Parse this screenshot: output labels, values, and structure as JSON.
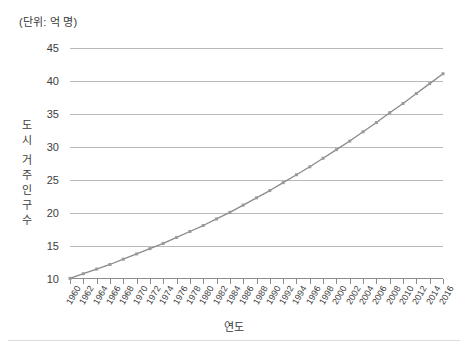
{
  "unit_caption": "(단위: 억 명)",
  "axis": {
    "y_title_chars": [
      "도",
      "시",
      "거",
      "주",
      "인",
      "구",
      "수"
    ],
    "x_title": "연도"
  },
  "chart_data": {
    "type": "line",
    "title": "",
    "subtitle": "",
    "unit_note": "(단위: 억 명)",
    "xlabel": "연도",
    "ylabel": "도시 거주 인구 수",
    "ylim": [
      10,
      45
    ],
    "ytick_step": 5,
    "ytick_labels": [
      "10",
      "15",
      "20",
      "25",
      "30",
      "35",
      "40",
      "45"
    ],
    "ytick_values": [
      10,
      15,
      20,
      25,
      30,
      35,
      40,
      45
    ],
    "xlim": [
      1960,
      2016
    ],
    "xtick_step": 2,
    "grid": "horizontal",
    "legend": "none",
    "marker": "square",
    "line_color": "#8a8a8a",
    "grid_color": "#b9b9b9",
    "categories": [
      "1960",
      "1962",
      "1964",
      "1966",
      "1968",
      "1970",
      "1972",
      "1974",
      "1976",
      "1978",
      "1980",
      "1982",
      "1984",
      "1986",
      "1988",
      "1990",
      "1992",
      "1994",
      "1996",
      "1998",
      "2000",
      "2002",
      "2004",
      "2006",
      "2008",
      "2010",
      "2012",
      "2014",
      "2016"
    ],
    "x": [
      1960,
      1962,
      1964,
      1966,
      1968,
      1970,
      1972,
      1974,
      1976,
      1978,
      1980,
      1982,
      1984,
      1986,
      1988,
      1990,
      1992,
      1994,
      1996,
      1998,
      2000,
      2002,
      2004,
      2006,
      2008,
      2010,
      2012,
      2014,
      2016
    ],
    "values": [
      10.1,
      10.8,
      11.5,
      12.2,
      13.0,
      13.8,
      14.6,
      15.4,
      16.3,
      17.2,
      18.1,
      19.1,
      20.1,
      21.2,
      22.3,
      23.4,
      24.6,
      25.8,
      27.0,
      28.3,
      29.6,
      30.9,
      32.3,
      33.7,
      35.2,
      36.6,
      38.1,
      39.6,
      41.1
    ],
    "series": [
      {
        "name": "도시 거주 인구 수",
        "values": [
          10.1,
          10.8,
          11.5,
          12.2,
          13.0,
          13.8,
          14.6,
          15.4,
          16.3,
          17.2,
          18.1,
          19.1,
          20.1,
          21.2,
          22.3,
          23.4,
          24.6,
          25.8,
          27.0,
          28.3,
          29.6,
          30.9,
          32.3,
          33.7,
          35.2,
          36.6,
          38.1,
          39.6,
          41.1
        ]
      }
    ],
    "annotations": []
  }
}
